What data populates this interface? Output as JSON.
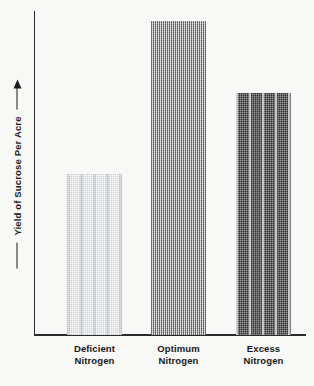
{
  "figure": {
    "background_color": "#f8f8f6",
    "ink_color": "#1b1b1b",
    "y_axis_label": "Yield of Sucrose Per Acre",
    "y_axis_arrow": "up-arrow",
    "scan_artifact_text": ""
  },
  "chart_data": {
    "type": "bar",
    "title": "",
    "xlabel": "",
    "ylabel": "Yield of Sucrose Per Acre",
    "categories": [
      "Deficient Nitrogen",
      "Optimum Nitrogen",
      "Excess Nitrogen"
    ],
    "category_lines": [
      [
        "Deficient",
        "Nitrogen"
      ],
      [
        "Optimum",
        "Nitrogen"
      ],
      [
        "Excess",
        "Nitrogen"
      ]
    ],
    "values": [
      51,
      100,
      77
    ],
    "value_units": "relative yield (no numeric scale shown)",
    "ylim": [
      0,
      100
    ],
    "grid": false,
    "legend": false,
    "axis_ticks_labeled": false,
    "bar_fills": [
      {
        "category": "Deficient Nitrogen",
        "pattern": "light-dot-halftone",
        "color": "#e9ebec"
      },
      {
        "category": "Optimum Nitrogen",
        "pattern": "medium-checker-halftone",
        "color": "#9a9a9a"
      },
      {
        "category": "Excess Nitrogen",
        "pattern": "dark-vertical-stripe",
        "color": "#2e2e2e"
      }
    ]
  },
  "bars": [
    {
      "label_line1": "Deficient",
      "label_line2": "Nitrogen",
      "left": 67,
      "width": 55,
      "height": 161
    },
    {
      "label_line1": "Optimum",
      "label_line2": "Nitrogen",
      "left": 151,
      "width": 55,
      "height": 314
    },
    {
      "label_line1": "Excess",
      "label_line2": "Nitrogen",
      "left": 236,
      "width": 55,
      "height": 242
    }
  ]
}
